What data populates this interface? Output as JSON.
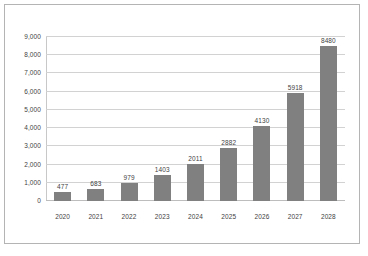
{
  "chart_data": {
    "type": "bar",
    "title": "",
    "subtitle": "",
    "xlabel": "",
    "ylabel": "",
    "categories": [
      "2020",
      "2021",
      "2022",
      "2023",
      "2024",
      "2025",
      "2026",
      "2027",
      "2028"
    ],
    "values": [
      477,
      683,
      979,
      1403,
      2011,
      2882,
      4130,
      5918,
      8480
    ],
    "data_labels": [
      "477",
      "683",
      "979",
      "1403",
      "2011",
      "2882",
      "4130",
      "5918",
      "8480"
    ],
    "ylim": [
      0,
      9000
    ],
    "ytick_values": [
      0,
      1000,
      2000,
      3000,
      4000,
      5000,
      6000,
      7000,
      8000,
      9000
    ],
    "ytick_labels": [
      "0",
      "1,000",
      "2,000",
      "3,000",
      "4,000",
      "5,000",
      "6,000",
      "7,000",
      "8,000",
      "9,000"
    ],
    "grid": true,
    "grid_axis": "y",
    "legend": false,
    "legend_position": "none",
    "series": [
      {
        "name": "",
        "values": [
          477,
          683,
          979,
          1403,
          2011,
          2882,
          4130,
          5918,
          8480
        ]
      }
    ]
  },
  "style": {
    "bar_color": "#808080",
    "gridline_color": "#d2d2d2",
    "axis_color": "#c8c8c8",
    "border_color": "#b4b4b4",
    "text_color": "#3f3f3f",
    "background": "#ffffff"
  }
}
